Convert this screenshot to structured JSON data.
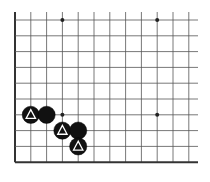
{
  "diagram": {
    "type": "go-board-fragment",
    "columns": 12,
    "rows": 10,
    "edges": {
      "left": true,
      "bottom": true,
      "top": false,
      "right": false
    },
    "colors": {
      "background": "#ffffff",
      "grid_line": "#555555",
      "edge_line": "#333333",
      "black_stone": "#111111",
      "marker": "#ffffff",
      "hoshi": "#222222"
    },
    "hoshi": [
      {
        "col": 3,
        "row": 0
      },
      {
        "col": 9,
        "row": 0
      },
      {
        "col": 3,
        "row": 6
      },
      {
        "col": 9,
        "row": 6
      }
    ],
    "stones": [
      {
        "color": "black",
        "col": 1,
        "row": 6,
        "marker": "triangle"
      },
      {
        "color": "black",
        "col": 2,
        "row": 6,
        "marker": "none"
      },
      {
        "color": "black",
        "col": 3,
        "row": 7,
        "marker": "triangle"
      },
      {
        "color": "black",
        "col": 4,
        "row": 7,
        "marker": "none"
      },
      {
        "color": "black",
        "col": 4,
        "row": 8,
        "marker": "triangle"
      }
    ]
  }
}
